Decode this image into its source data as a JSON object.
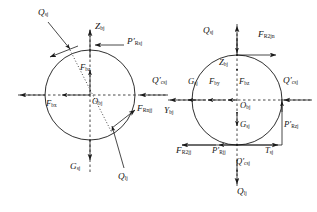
{
  "figure": {
    "type": "engineering-force-diagram",
    "panel_count": 2,
    "stroke_color": "#1a1a1a",
    "background_color": "#ffffff"
  },
  "left_panel": {
    "name": "left-force-diagram",
    "circle": {
      "cx": 90,
      "cy": 95,
      "r": 45
    },
    "origin_label": "O",
    "origin_sub": "bj",
    "labels": [
      {
        "id": "q-sj",
        "base": "Q",
        "sub": "sj",
        "prime": false,
        "x": 38,
        "y": 8,
        "size": "s9"
      },
      {
        "id": "z-bj",
        "base": "Z",
        "sub": "bj",
        "prime": false,
        "x": 95,
        "y": 22,
        "size": "s9"
      },
      {
        "id": "p-rsj",
        "base": "P",
        "sub": "Rsj",
        "prime": true,
        "x": 127,
        "y": 40,
        "size": "s9"
      },
      {
        "id": "f-bz",
        "base": "F",
        "sub": "bz",
        "prime": false,
        "x": 82,
        "y": 64,
        "size": "s85"
      },
      {
        "id": "q-csj",
        "base": "Q",
        "sub": "csj",
        "prime": true,
        "x": 152,
        "y": 78,
        "size": "s9"
      },
      {
        "id": "f-bx",
        "base": "F",
        "sub": "bx",
        "prime": false,
        "x": 48,
        "y": 98,
        "size": "s85"
      },
      {
        "id": "o-bj",
        "base": "O",
        "sub": "bj",
        "prime": false,
        "x": 93,
        "y": 96,
        "size": "s85"
      },
      {
        "id": "f-rnjj",
        "base": "F",
        "sub": "Rnjj",
        "prime": false,
        "x": 133,
        "y": 108,
        "size": "s9"
      },
      {
        "id": "g-sj",
        "base": "G",
        "sub": "sj",
        "prime": false,
        "x": 72,
        "y": 163,
        "size": "s9"
      },
      {
        "id": "q-lj",
        "base": "Q",
        "sub": "lj",
        "prime": false,
        "x": 118,
        "y": 176,
        "size": "s9"
      }
    ]
  },
  "right_panel": {
    "name": "right-force-diagram",
    "circle": {
      "cx": 237,
      "cy": 100,
      "r": 45
    },
    "origin_label": "O",
    "origin_sub": "bj",
    "labels": [
      {
        "id": "r-q-sj",
        "base": "Q",
        "sub": "sj",
        "prime": false,
        "x": 203,
        "y": 32,
        "size": "s9"
      },
      {
        "id": "r-f-r2jn",
        "base": "F",
        "sub": "R2jn",
        "prime": false,
        "x": 256,
        "y": 32,
        "size": "s9"
      },
      {
        "id": "r-z-bj",
        "base": "Z",
        "sub": "bj",
        "prime": false,
        "x": 219,
        "y": 61,
        "size": "s85"
      },
      {
        "id": "r-g-sj",
        "base": "G",
        "sub": "sj",
        "prime": false,
        "x": 190,
        "y": 79,
        "size": "s85"
      },
      {
        "id": "r-f-by",
        "base": "F",
        "sub": "by",
        "prime": false,
        "x": 211,
        "y": 79,
        "size": "s85"
      },
      {
        "id": "r-f-bz",
        "base": "F",
        "sub": "bz",
        "prime": false,
        "x": 240,
        "y": 79,
        "size": "s85"
      },
      {
        "id": "r-q-csj",
        "base": "Q",
        "sub": "csj",
        "prime": true,
        "x": 283,
        "y": 78,
        "size": "s9"
      },
      {
        "id": "r-y-bj",
        "base": "Y",
        "sub": "bj",
        "prime": false,
        "x": 164,
        "y": 106,
        "size": "s9"
      },
      {
        "id": "r-o-bj",
        "base": "O",
        "sub": "bj",
        "prime": false,
        "x": 240,
        "y": 99,
        "size": "s85"
      },
      {
        "id": "r-g-sj2",
        "base": "G",
        "sub": "sj",
        "prime": false,
        "x": 240,
        "y": 117,
        "size": "s85"
      },
      {
        "id": "r-p-rzj",
        "base": "P",
        "sub": "Rzj",
        "prime": true,
        "x": 279,
        "y": 123,
        "size": "s85"
      },
      {
        "id": "r-f-r2jj",
        "base": "F",
        "sub": "R2jj",
        "prime": false,
        "x": 178,
        "y": 142,
        "size": "s9"
      },
      {
        "id": "r-p-rjj",
        "base": "P",
        "sub": "Rjj",
        "prime": true,
        "x": 214,
        "y": 142,
        "size": "s85"
      },
      {
        "id": "r-t-sj",
        "base": "T",
        "sub": "sj",
        "prime": false,
        "x": 267,
        "y": 142,
        "size": "s85"
      },
      {
        "id": "r-q-csj2",
        "base": "Q",
        "sub": "csj",
        "prime": true,
        "x": 238,
        "y": 158,
        "size": "s85"
      },
      {
        "id": "r-q-lj",
        "base": "Q",
        "sub": "lj",
        "prime": false,
        "x": 238,
        "y": 190,
        "size": "s9"
      }
    ]
  }
}
